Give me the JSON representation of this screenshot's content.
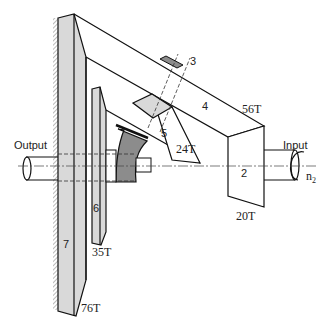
{
  "labels": {
    "output": "Output",
    "input": "Input",
    "speed": "n",
    "speed_sub": "2"
  },
  "parts": [
    {
      "id": "2",
      "label": "2",
      "teeth": "20T"
    },
    {
      "id": "3",
      "label": "3",
      "teeth": ""
    },
    {
      "id": "4",
      "label": "4",
      "teeth": "56T"
    },
    {
      "id": "5",
      "label": "5",
      "teeth": "24T"
    },
    {
      "id": "6",
      "label": "6",
      "teeth": "35T"
    },
    {
      "id": "7",
      "label": "7",
      "teeth": "76T"
    }
  ],
  "colors": {
    "light_fill": "#d9d9d9",
    "dark_fill": "#8c8c8c",
    "line": "#111111"
  }
}
